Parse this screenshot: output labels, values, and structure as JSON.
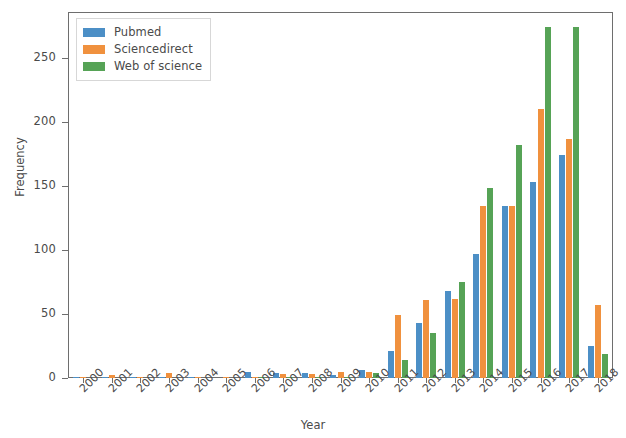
{
  "chart_data": {
    "type": "bar",
    "title": "",
    "xlabel": "Year",
    "ylabel": "Frequency",
    "grid": false,
    "legend_position": "upper left",
    "ylim": [
      0,
      285
    ],
    "yticks": [
      0,
      50,
      100,
      150,
      200,
      250
    ],
    "categories": [
      "2000",
      "2001",
      "2002",
      "2003",
      "2004",
      "2005",
      "2006",
      "2007",
      "2008",
      "2009",
      "2010",
      "2011",
      "2012",
      "2013",
      "2014",
      "2015",
      "2016",
      "2017",
      "2018"
    ],
    "series": [
      {
        "name": "Pubmed",
        "color": "#4c8fc6",
        "values": [
          1,
          1,
          1,
          1,
          1,
          0,
          5,
          4,
          4,
          2,
          6,
          21,
          43,
          68,
          97,
          134,
          153,
          174,
          25
        ]
      },
      {
        "name": "Sciencedirect",
        "color": "#f0913e",
        "values": [
          1,
          2,
          1,
          4,
          1,
          1,
          1,
          3,
          3,
          5,
          5,
          49,
          61,
          62,
          134,
          134,
          210,
          187,
          57
        ]
      },
      {
        "name": "Web of science",
        "color": "#56a356",
        "values": [
          0,
          0,
          0,
          0,
          0,
          0,
          1,
          1,
          1,
          1,
          4,
          14,
          35,
          75,
          148,
          182,
          274,
          274,
          19
        ]
      }
    ]
  },
  "axes": {
    "ylabel": "Frequency",
    "xlabel": "Year",
    "ytick_labels": [
      "0",
      "50",
      "100",
      "150",
      "200",
      "250"
    ],
    "xtick_labels": [
      "2000",
      "2001",
      "2002",
      "2003",
      "2004",
      "2005",
      "2006",
      "2007",
      "2008",
      "2009",
      "2010",
      "2011",
      "2012",
      "2013",
      "2014",
      "2015",
      "2016",
      "2017",
      "2018"
    ]
  },
  "legend": {
    "entries": [
      {
        "label": "Pubmed",
        "color": "#4c8fc6"
      },
      {
        "label": "Sciencedirect",
        "color": "#f0913e"
      },
      {
        "label": "Web of science",
        "color": "#56a356"
      }
    ]
  }
}
